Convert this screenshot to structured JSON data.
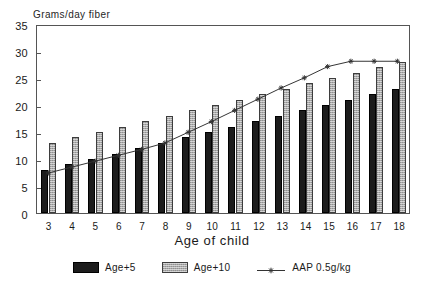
{
  "chart_data": {
    "type": "bar",
    "title": "",
    "xlabel": "Age of child",
    "ylabel": "Grams/day fiber",
    "categories": [
      "3",
      "4",
      "5",
      "6",
      "7",
      "8",
      "9",
      "10",
      "11",
      "12",
      "13",
      "14",
      "15",
      "16",
      "17",
      "18"
    ],
    "ylim": [
      0,
      35
    ],
    "yticks": [
      0,
      5,
      10,
      15,
      20,
      25,
      30,
      35
    ],
    "grid": false,
    "legend_position": "bottom",
    "series": [
      {
        "name": "Age+5",
        "type": "bar",
        "color": "#1c1c1c",
        "values": [
          8,
          9,
          10,
          11,
          12,
          13,
          14,
          15,
          16,
          17,
          18,
          19,
          20,
          21,
          22,
          23
        ]
      },
      {
        "name": "Age+10",
        "type": "bar",
        "color": "#a9a9a9",
        "values": [
          13,
          14,
          15,
          16,
          17,
          18,
          19,
          20,
          21,
          22,
          23,
          24,
          25,
          26,
          27,
          28
        ]
      },
      {
        "name": "AAP 0.5g/kg",
        "type": "line",
        "color": "#333333",
        "marker": "star",
        "values": [
          7.5,
          8.6,
          9.7,
          10.8,
          11.9,
          13.1,
          15.1,
          17.1,
          19.2,
          21.3,
          23.4,
          25.3,
          27.4,
          28.4,
          28.4,
          28.4
        ]
      }
    ]
  },
  "axis": {
    "ytick_labels": [
      "0",
      "5",
      "10",
      "15",
      "20",
      "25",
      "30",
      "35"
    ],
    "xtick_labels": [
      "3",
      "4",
      "5",
      "6",
      "7",
      "8",
      "9",
      "10",
      "11",
      "12",
      "13",
      "14",
      "15",
      "16",
      "17",
      "18"
    ],
    "y_title": "Grams/day fiber",
    "x_title": "Age of child"
  },
  "legend": {
    "entries": [
      {
        "label": "Age+5",
        "swatch": "dark-bar-swatch"
      },
      {
        "label": "Age+10",
        "swatch": "light-bar-swatch"
      },
      {
        "label": "AAP 0.5g/kg",
        "swatch": "line-star-swatch"
      }
    ]
  }
}
